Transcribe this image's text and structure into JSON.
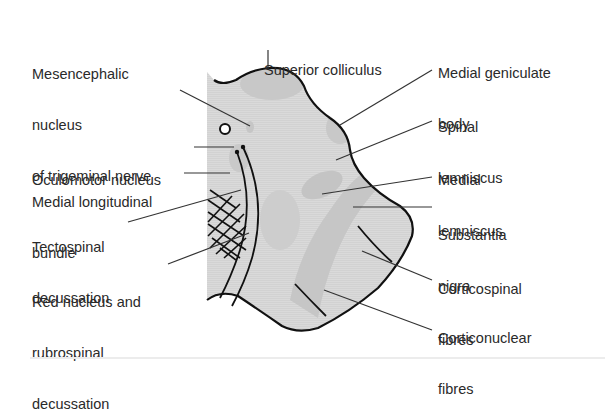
{
  "figure": {
    "colors": {
      "background": "#ffffff",
      "section_fill": "#d9d9d9",
      "region_fill": "#c4c4c4",
      "outline": "#111111",
      "leader": "#333333",
      "text": "#2a2a2a"
    }
  },
  "labels_left": [
    {
      "id": "mesencephalic-nucleus",
      "lines": [
        "Mesencephalic",
        "nucleus",
        "of trigeminal nerve"
      ]
    },
    {
      "id": "oculomotor-nucleus",
      "lines": [
        "Oculomotor nucleus"
      ]
    },
    {
      "id": "medial-longitudinal-bundle",
      "lines": [
        "Medial longitudinal",
        "bundle"
      ]
    },
    {
      "id": "tectospinal-decussation",
      "lines": [
        "Tectospinal",
        "decussation"
      ]
    },
    {
      "id": "red-nucleus",
      "lines": [
        "Red nucleus and",
        "rubrospinal",
        "decussation"
      ]
    }
  ],
  "labels_top": [
    {
      "id": "superior-colliculus",
      "lines": [
        "Superior colliculus"
      ]
    }
  ],
  "labels_right": [
    {
      "id": "medial-geniculate-body",
      "lines": [
        "Medial geniculate",
        "body"
      ]
    },
    {
      "id": "spinal-lemniscus",
      "lines": [
        "Spinal",
        "lemniscus"
      ]
    },
    {
      "id": "medial-lemniscus",
      "lines": [
        "Medial",
        "lemniscus"
      ]
    },
    {
      "id": "substantia-nigra",
      "lines": [
        "Substantia",
        "nigra"
      ]
    },
    {
      "id": "corticospinal-fibres",
      "lines": [
        "Corticospinal",
        "fibres"
      ]
    },
    {
      "id": "corticonuclear-fibres",
      "lines": [
        "Corticonuclear",
        "fibres"
      ]
    }
  ]
}
